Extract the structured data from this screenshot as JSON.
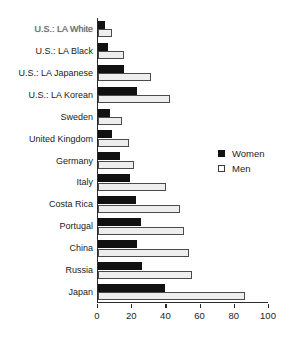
{
  "chart_data": {
    "type": "bar",
    "orientation": "horizontal",
    "title": "",
    "xlabel": "",
    "ylabel": "",
    "xlim": [
      0,
      100
    ],
    "xticks": [
      0,
      20,
      40,
      60,
      80,
      100
    ],
    "grid": false,
    "legend_position": "right-middle",
    "categories": [
      "U.S.: LA White",
      "U.S.: LA Black",
      "U.S.: LA Japanese",
      "U.S.: LA Korean",
      "Sweden",
      "United Kingdom",
      "Germany",
      "Italy",
      "Costa Rica",
      "Portugal",
      "China",
      "Russia",
      "Japan"
    ],
    "series": [
      {
        "name": "Women",
        "color": "#111111",
        "values": [
          4,
          6,
          15,
          23,
          7,
          8,
          13,
          19,
          22,
          25,
          23,
          26,
          39
        ]
      },
      {
        "name": "Men",
        "color": "#eeeeee",
        "values": [
          8,
          15,
          31,
          42,
          14,
          18,
          21,
          40,
          48,
          50,
          53,
          55,
          86
        ]
      }
    ]
  },
  "legend": {
    "items": [
      {
        "label": "Women",
        "swatch": "filled-square-icon"
      },
      {
        "label": "Men",
        "swatch": "open-square-icon"
      }
    ]
  },
  "axis": {
    "x_tick_labels": [
      "0",
      "20",
      "40",
      "60",
      "80",
      "100"
    ]
  }
}
